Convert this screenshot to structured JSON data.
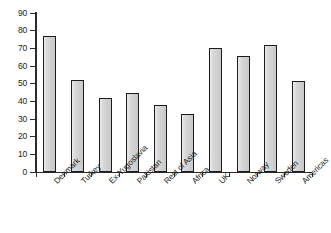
{
  "chart_data": {
    "type": "bar",
    "title": "",
    "subtitle": "",
    "xlabel": "",
    "ylabel": "",
    "categories": [
      "Denmark",
      "Turkey",
      "Ex-Yugoslavia",
      "Pakistan",
      "Rest of Asia",
      "Africa",
      "UK",
      "Norway",
      "Sweden",
      "Americas"
    ],
    "values": [
      77,
      52,
      42,
      45,
      38,
      33,
      70,
      65.5,
      72,
      51.5
    ],
    "ylim": [
      0,
      90
    ],
    "ytick_labels": [
      "90",
      "80",
      "70",
      "60",
      "50",
      "40",
      "30",
      "20",
      "10",
      "0"
    ],
    "ytick_values": [
      90,
      80,
      70,
      60,
      50,
      40,
      30,
      20,
      10,
      0
    ],
    "ytick_step": 10,
    "grid": false,
    "legend": false,
    "legend_position": "none",
    "annotations": [],
    "bar_fill_color": "#d3d3d3",
    "bar_edge_color": "#1c1c1c",
    "axis_color": "#2b2b2b",
    "background_color": "#ffffff",
    "xtick_label_rotation": -45
  }
}
